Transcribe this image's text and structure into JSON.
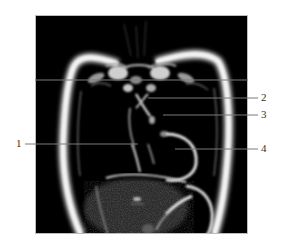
{
  "figure": {
    "type": "coronal MRI of thorax with numbered callouts",
    "background": "#ffffff",
    "image_background": "#000000",
    "line_color": "#7a7a7a"
  },
  "labels": [
    {
      "id": "1",
      "text": "1",
      "side": "left"
    },
    {
      "id": "2",
      "text": "2",
      "side": "right"
    },
    {
      "id": "3",
      "text": "3",
      "side": "right"
    },
    {
      "id": "4",
      "text": "4",
      "side": "right"
    }
  ]
}
